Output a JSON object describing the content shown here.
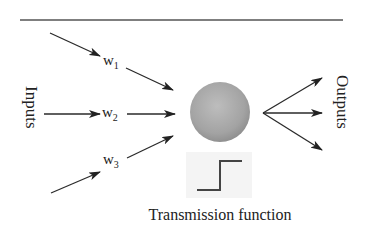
{
  "diagram": {
    "type": "perceptron / artificial neuron",
    "inputs_label": "Inputs",
    "outputs_label": "Outputs",
    "caption": "Transmission function",
    "weights": [
      {
        "base": "w",
        "sub": "1"
      },
      {
        "base": "w",
        "sub": "2"
      },
      {
        "base": "w",
        "sub": "3"
      }
    ],
    "input_count": 3,
    "output_count": 3,
    "node": {
      "shape": "sphere",
      "color": "#a0a0a0"
    },
    "transmission_function": "step",
    "colors": {
      "line": "#2a2a2a",
      "node_light": "#bdbdbd",
      "node_dark": "#8a8a8a",
      "step_box_bg": "#f4f4f4"
    }
  }
}
